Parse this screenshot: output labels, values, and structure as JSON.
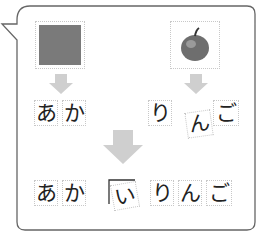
{
  "top_left": {
    "image": "gray-square",
    "color": "#7a7a7a",
    "word": [
      "あ",
      "か"
    ]
  },
  "top_right": {
    "image": "apple",
    "word": [
      "り",
      "ん",
      "ご"
    ]
  },
  "result": {
    "chars": [
      "あ",
      "か",
      "い",
      "り",
      "ん",
      "ご"
    ]
  },
  "colors": {
    "outline": "#666666",
    "arrow": "#cfcfcf",
    "text": "#222222"
  }
}
